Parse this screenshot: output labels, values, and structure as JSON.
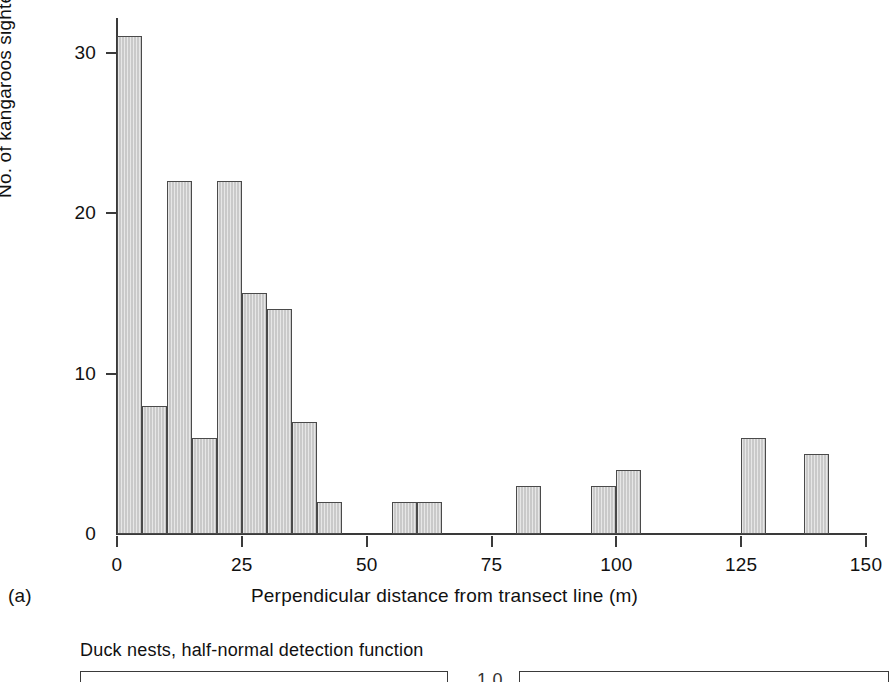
{
  "figure": {
    "panel_a": {
      "panel_label": "(a)",
      "x_axis_title": "Perpendicular distance from transect line (m)",
      "y_axis_title": "No. of kangaroos sighted"
    },
    "panel_b": {
      "title": "Duck nests, half-normal detection function",
      "right_axis_tick": "1.0"
    }
  },
  "chart_data": {
    "type": "bar",
    "title": "",
    "subtitle": "",
    "xlabel": "Perpendicular distance from transect line (m)",
    "ylabel": "No. of kangaroos sighted",
    "xlim": [
      0,
      150
    ],
    "ylim": [
      0,
      33
    ],
    "grid": false,
    "legend": null,
    "bin_width": 5,
    "x_ticks": [
      0,
      25,
      50,
      75,
      100,
      125,
      150
    ],
    "x_tick_labels": [
      "0",
      "25",
      "50",
      "75",
      "100",
      "125",
      "150"
    ],
    "y_ticks": [
      0,
      10,
      20,
      30
    ],
    "y_tick_labels": [
      "0",
      "10",
      "20",
      "30"
    ],
    "bars": [
      {
        "bin_start": 0,
        "bin_end": 5,
        "value": 31
      },
      {
        "bin_start": 5,
        "bin_end": 10,
        "value": 8
      },
      {
        "bin_start": 10,
        "bin_end": 15,
        "value": 22
      },
      {
        "bin_start": 15,
        "bin_end": 20,
        "value": 6
      },
      {
        "bin_start": 20,
        "bin_end": 25,
        "value": 22
      },
      {
        "bin_start": 25,
        "bin_end": 30,
        "value": 15
      },
      {
        "bin_start": 30,
        "bin_end": 35,
        "value": 14
      },
      {
        "bin_start": 35,
        "bin_end": 40,
        "value": 7
      },
      {
        "bin_start": 40,
        "bin_end": 45,
        "value": 2
      },
      {
        "bin_start": 55,
        "bin_end": 60,
        "value": 2
      },
      {
        "bin_start": 60,
        "bin_end": 65,
        "value": 2
      },
      {
        "bin_start": 80,
        "bin_end": 85,
        "value": 3
      },
      {
        "bin_start": 95,
        "bin_end": 100,
        "value": 3
      },
      {
        "bin_start": 100,
        "bin_end": 105,
        "value": 4
      },
      {
        "bin_start": 125,
        "bin_end": 130,
        "value": 6
      },
      {
        "bin_start": 137.5,
        "bin_end": 142.5,
        "value": 5
      }
    ],
    "categories": [
      "0-5",
      "5-10",
      "10-15",
      "15-20",
      "20-25",
      "25-30",
      "30-35",
      "35-40",
      "40-45",
      "55-60",
      "60-65",
      "80-85",
      "95-100",
      "100-105",
      "125-130",
      "137.5-142.5"
    ],
    "values": [
      31,
      8,
      22,
      6,
      22,
      15,
      14,
      7,
      2,
      2,
      2,
      3,
      3,
      4,
      6,
      5
    ],
    "colors": {
      "bar_fill": "#c9c9c9",
      "bar_stroke": "#4a4a4a",
      "axis": "#3a3a3a",
      "text": "#111111",
      "background": "#ffffff"
    }
  }
}
